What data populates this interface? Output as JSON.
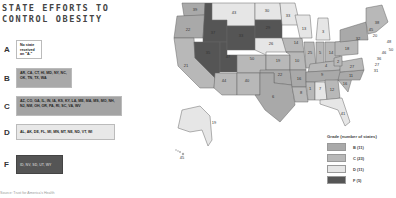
{
  "title": {
    "line1": "STATE EFFORTS TO",
    "line2": "CONTROL OBESITY"
  },
  "grades": [
    {
      "letter": "A",
      "states": "No state received an \"A.\"",
      "color": "#ffffff"
    },
    {
      "letter": "B",
      "states": "AR, CA, CT, HI, MD, NY, NC, OK, TN, TX, WA",
      "color": "#a9a9a9"
    },
    {
      "letter": "C",
      "states": "AZ, CO, GA, IL, IN, IA, KS, KY, LA, ME, MA, MS, MO, NH, NJ, NM, OH, OR, PA, RI, SC, VA, WV",
      "color": "#b8b8b8"
    },
    {
      "letter": "D",
      "states": "AL, AK, DE, FL, MI, MN, MT, NE, ND, VT, WI",
      "color": "#e6e6e6"
    },
    {
      "letter": "F",
      "states": "ID, NV, SD, UT, WY",
      "color": "#555555"
    }
  ],
  "legend": {
    "title": "Grade (number of states)",
    "items": [
      {
        "label": "B (11)",
        "color": "#a9a9a9"
      },
      {
        "label": "C (23)",
        "color": "#b8b8b8"
      },
      {
        "label": "D (11)",
        "color": "#e6e6e6"
      },
      {
        "label": "F (5)",
        "color": "#555555"
      }
    ]
  },
  "map_labels": {
    "WA": "39",
    "OR": "22",
    "CA": "21",
    "ID": "37",
    "NV": "35",
    "UT": "47",
    "MT": "43",
    "WY": "33",
    "CO": "50",
    "AZ": "44",
    "NM": "40",
    "ND": "30",
    "SD": "29",
    "NE": "26",
    "KS": "19",
    "OK": "22",
    "TX": "6",
    "MN": "33",
    "IA": "14",
    "MO": "10",
    "AR": "16",
    "LA": "8",
    "WI": "13",
    "MI": "3",
    "IL": "25",
    "IN": "5",
    "OH": "14",
    "KY": "4",
    "TN": "9",
    "MS": "1",
    "AL": "7",
    "GA": "12",
    "FL": "41",
    "SC": "16",
    "NC": "11",
    "VA": "27",
    "WV": "2",
    "PA": "18",
    "NY": "32",
    "ME": "38",
    "VT": "45",
    "NH": "20",
    "MA": "48",
    "RI": "50",
    "CT": "46",
    "NJ": "36",
    "DE": "27",
    "MD": "31",
    "AK": "19",
    "HI": "45"
  },
  "footer": "Source: Trust for America's Health"
}
